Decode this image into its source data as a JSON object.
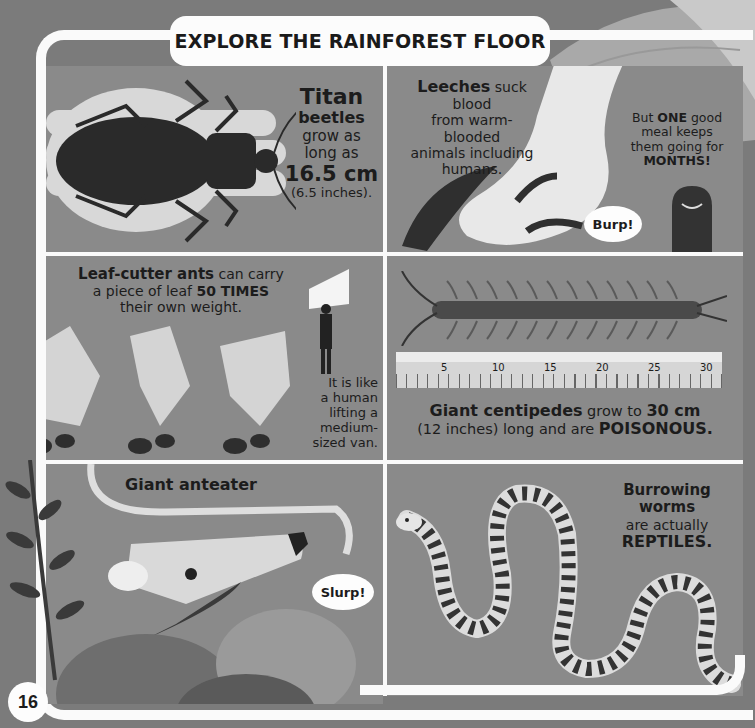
{
  "page": {
    "title": "EXPLORE THE RAINFOREST FLOOR",
    "page_number": "16"
  },
  "panels": {
    "titan_beetle": {
      "line1": "Titan",
      "line2": "beetles",
      "line3": "grow as",
      "line4": "long as",
      "size": "16.5 cm",
      "size_imperial": "(6.5 inches)."
    },
    "leeches": {
      "bold": "Leeches",
      "text1": " suck blood",
      "text2": "from warm-blooded",
      "text3": "animals including",
      "text4": "humans.",
      "side_pre": "But ",
      "side_bold": "ONE",
      "side_post": " good",
      "side2": "meal keeps",
      "side3": "them going for",
      "side4": "MONTHS!",
      "bubble": "Burp!"
    },
    "leaf_cutter": {
      "bold": "Leaf-cutter ants",
      "text1": " can carry",
      "text2_pre": "a piece of leaf ",
      "text2_bold": "50 TIMES",
      "text3": "their own weight.",
      "side1": "It is like",
      "side2": "a human",
      "side3": "lifting a",
      "side4": "medium-",
      "side5": "sized van."
    },
    "centipede": {
      "bold": "Giant centipedes",
      "text1": " grow to ",
      "size": "30 cm",
      "text2": "(12 inches) long and are ",
      "warn": "POISONOUS.",
      "ruler_labels": [
        "5",
        "10",
        "15",
        "20",
        "25",
        "30"
      ]
    },
    "anteater": {
      "title": "Giant anteater",
      "bubble": "Slurp!"
    },
    "worms": {
      "line1": "Burrowing",
      "line2": "worms",
      "line3": "are actually",
      "line4": "REPTILES."
    }
  },
  "colors": {
    "background": "#7b7b7b",
    "panel": "#8a8a8a",
    "frame": "#fafafa",
    "ink": "#1c1c1c"
  }
}
